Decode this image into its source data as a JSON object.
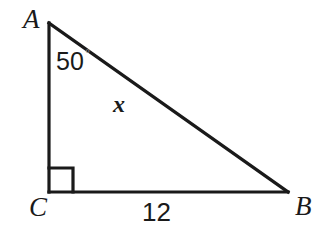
{
  "figure": {
    "type": "right-triangle-diagram",
    "background_color": "#ffffff",
    "stroke_color": "#1a1a1a",
    "degree_symbol_color": "#8c8c8c"
  },
  "vertices": {
    "a": {
      "label": "A",
      "x": 49,
      "y": 23
    },
    "c": {
      "label": "C",
      "x": 49,
      "y": 192
    },
    "b": {
      "label": "B",
      "x": 288,
      "y": 192
    }
  },
  "angles": {
    "at_a": {
      "value": "50",
      "degree_symbol": "°"
    },
    "at_c": {
      "value": "90",
      "marker": "right-angle-square"
    }
  },
  "sides": {
    "hypotenuse": {
      "label": "x",
      "from": "A",
      "to": "B"
    },
    "base": {
      "label": "12",
      "from": "C",
      "to": "B"
    },
    "vertical": {
      "label": "",
      "from": "A",
      "to": "C"
    }
  }
}
